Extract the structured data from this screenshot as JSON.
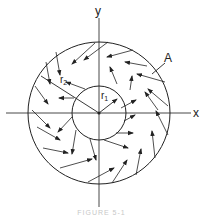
{
  "figure": {
    "axis_labels": {
      "x": "x",
      "y": "y"
    },
    "radius_labels": {
      "r1": "r",
      "r1_sub": "1",
      "r2": "r",
      "r2_sub": "2"
    },
    "point_label": "A",
    "caption": "FIGURE 5-1",
    "colors": {
      "line": "#222222",
      "background": "#ffffff"
    },
    "geometry": {
      "center": [
        99,
        113
      ],
      "inner_radius": 27,
      "outer_radius": 71
    },
    "arrows": [
      [
        95,
        43,
        72,
        64
      ],
      [
        108,
        42,
        84,
        60
      ],
      [
        133,
        50,
        107,
        57
      ],
      [
        147,
        66,
        125,
        62
      ],
      [
        165,
        82,
        137,
        74
      ],
      [
        168,
        106,
        148,
        89
      ],
      [
        158,
        110,
        145,
        92
      ],
      [
        56,
        52,
        60,
        75
      ],
      [
        46,
        62,
        50,
        84
      ],
      [
        35,
        86,
        48,
        104
      ],
      [
        32,
        110,
        50,
        128
      ],
      [
        37,
        127,
        60,
        140
      ],
      [
        43,
        148,
        68,
        153
      ],
      [
        60,
        168,
        92,
        159
      ],
      [
        88,
        182,
        114,
        168
      ],
      [
        112,
        183,
        127,
        160
      ],
      [
        136,
        175,
        141,
        149
      ],
      [
        155,
        158,
        152,
        131
      ],
      [
        168,
        135,
        156,
        111
      ],
      [
        117,
        84,
        110,
        67
      ],
      [
        130,
        90,
        132,
        76
      ],
      [
        121,
        108,
        136,
        100
      ],
      [
        124,
        121,
        135,
        115
      ],
      [
        116,
        133,
        133,
        133
      ],
      [
        104,
        140,
        128,
        148
      ],
      [
        90,
        139,
        96,
        160
      ],
      [
        76,
        130,
        72,
        154
      ],
      [
        72,
        117,
        58,
        132
      ],
      [
        74,
        98,
        59,
        98
      ],
      [
        85,
        89,
        66,
        82
      ]
    ],
    "radius_lines": {
      "r1": [
        99,
        113,
        117,
        99
      ],
      "r2": [
        99,
        113,
        41,
        76
      ]
    },
    "leader_A": [
      165,
      63,
      152,
      74
    ]
  }
}
